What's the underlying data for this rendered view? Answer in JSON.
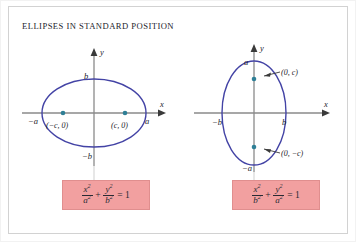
{
  "figure": {
    "title": "ELLIPSES IN STANDARD POSITION",
    "background_color": "#ffffff",
    "frame_color": "#d2d2d2",
    "ellipse_color": "#4343a5",
    "axis_color": "#8a8a8a",
    "focus_dot_color": "#2f7f96",
    "formula_box_color": "#f2a0a0",
    "text_color": "#23232b"
  },
  "panels": [
    {
      "id": "horizontal-ellipse",
      "axis_x_label": "x",
      "axis_y_label": "y",
      "vertex_left_label": "−a",
      "vertex_right_label": "a",
      "covertex_top_label": "b",
      "covertex_bottom_label": "−b",
      "focus_left_label": "(−c, 0)",
      "focus_right_label": "(c, 0)",
      "equation": {
        "num1": "x",
        "num1_exp": "2",
        "den1": "a",
        "den1_exp": "2",
        "operator": "+",
        "num2": "y",
        "num2_exp": "2",
        "den2": "b",
        "den2_exp": "2",
        "equals": "= 1"
      }
    },
    {
      "id": "vertical-ellipse",
      "axis_x_label": "x",
      "axis_y_label": "y",
      "vertex_top_label": "a",
      "vertex_bottom_label": "−a",
      "covertex_left_label": "−b",
      "covertex_right_label": "b",
      "focus_top_label": "(0, c)",
      "focus_bottom_label": "(0, −c)",
      "equation": {
        "num1": "x",
        "num1_exp": "2",
        "den1": "b",
        "den1_exp": "2",
        "operator": "+",
        "num2": "y",
        "num2_exp": "2",
        "den2": "a",
        "den2_exp": "2",
        "equals": "= 1"
      }
    }
  ]
}
